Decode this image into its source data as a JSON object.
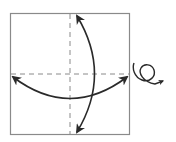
{
  "diagram": {
    "type": "origami-fold-instruction",
    "colors": {
      "paper_edge": "#8a8a8a",
      "fold_line": "#8a8a8a",
      "arrow": "#2a2a2a",
      "background": "#ffffff"
    },
    "elements": [
      {
        "name": "paper-square",
        "shape": "square"
      },
      {
        "name": "vertical-fold-line",
        "style": "dashed"
      },
      {
        "name": "horizontal-fold-line",
        "style": "dashed"
      },
      {
        "name": "vertical-fold-unfold-arrow",
        "style": "double-headed curved"
      },
      {
        "name": "horizontal-fold-unfold-arrow",
        "style": "double-headed curved"
      },
      {
        "name": "turn-over-symbol",
        "meaning": "turn the paper over"
      }
    ]
  }
}
